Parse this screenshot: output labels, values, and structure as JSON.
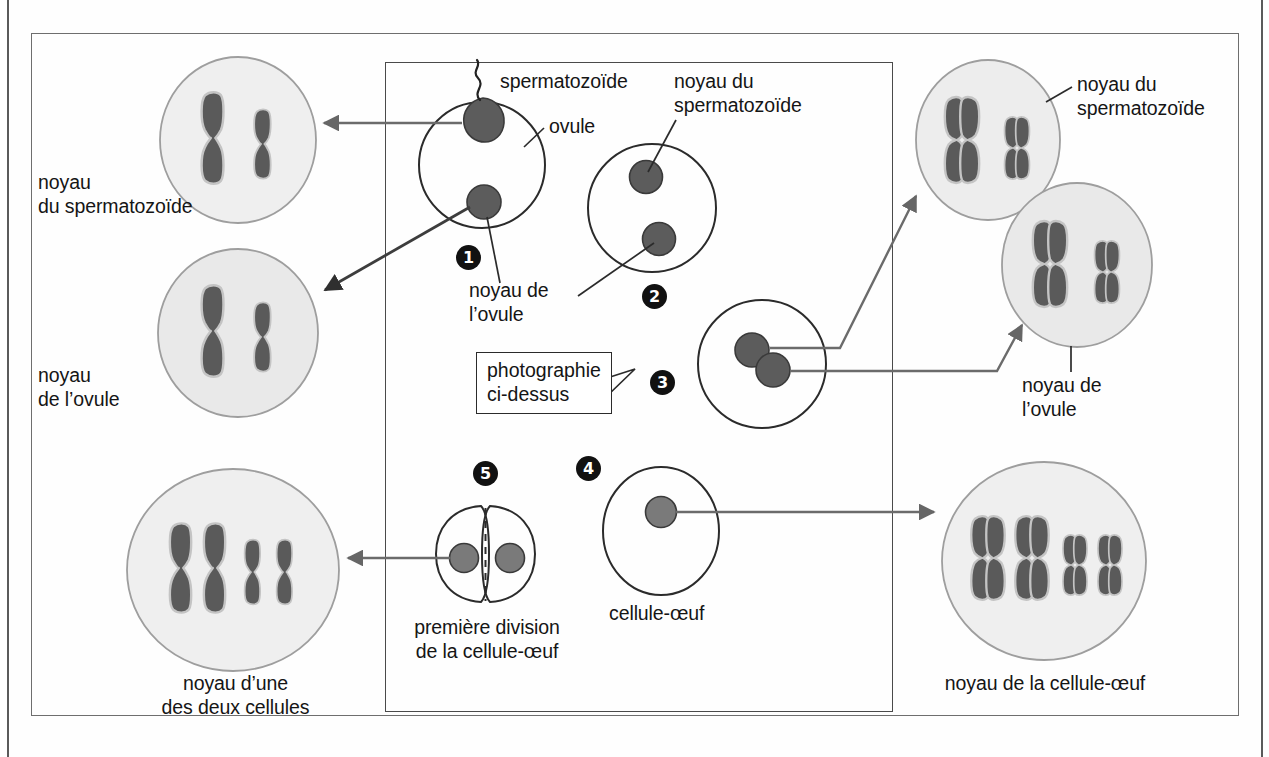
{
  "diagram": {
    "title_visible": false,
    "language": "fr",
    "colors": {
      "chromosome_fill": "#5a5a5a",
      "chromosome_stroke": "#bdbdbd",
      "nucleus_fill": "#6b6b6b",
      "nucleus_stroke": "#3a3a3a",
      "magnified_circle_fill": "#efefef",
      "magnified_circle_stroke": "#9a9a9a",
      "cell_outline": "#2b2b2b",
      "arrow": "#555555",
      "leader_line": "#2b2b2b",
      "frame": "#6e6e6e",
      "badge_bg": "#111111",
      "badge_text": "#ffffff"
    },
    "labels": {
      "noyau_du_spermatozoide_left": "noyau\ndu spermatozoïde",
      "noyau_de_lovule_left": "noyau\nde l’ovule",
      "noyau_dune_des_deux_cellules": "noyau d’une\ndes deux cellules",
      "spermatozoide": "spermatozoïde",
      "ovule": "ovule",
      "noyau_de_lovule_center": "noyau de\nl’ovule",
      "noyau_du_spermatozoide_center": "noyau du\nspermatozoïde",
      "noyau_du_spermatozoide_right": "noyau du\nspermatozoïde",
      "noyau_de_lovule_right": "noyau de\nl’ovule",
      "cellule_oeuf": "cellule-œuf",
      "premiere_division": "première division\nde la cellule-œuf",
      "noyau_de_la_cellule_oeuf": "noyau de la cellule-œuf"
    },
    "callout": {
      "text": "photographie\nci-dessus",
      "points_to_step": "3"
    },
    "steps": [
      {
        "number": "1",
        "marker": "❶",
        "caption": "ovule fécondé par le spermatozoïde"
      },
      {
        "number": "2",
        "marker": "❷",
        "caption": "les deux noyaux dans l’ovule"
      },
      {
        "number": "3",
        "marker": "❸",
        "caption": "rapprochement des deux noyaux"
      },
      {
        "number": "4",
        "marker": "❹",
        "caption": "cellule-œuf"
      },
      {
        "number": "5",
        "marker": "❺",
        "caption": "première division de la cellule-œuf"
      }
    ],
    "magnified_nuclei": [
      {
        "id": "sperm-nucleus-single",
        "chromosome_style": "single-chromatid",
        "count": 2,
        "label_key": "noyau_du_spermatozoide_left"
      },
      {
        "id": "ovule-nucleus-single",
        "chromosome_style": "single-chromatid",
        "count": 2,
        "label_key": "noyau_de_lovule_left"
      },
      {
        "id": "sperm-nucleus-doubled",
        "chromosome_style": "double-chromatid",
        "count": 2,
        "label_key": "noyau_du_spermatozoide_right"
      },
      {
        "id": "ovule-nucleus-doubled",
        "chromosome_style": "double-chromatid",
        "count": 2,
        "label_key": "noyau_de_lovule_right"
      },
      {
        "id": "egg-cell-nucleus",
        "chromosome_style": "double-chromatid",
        "count": 4,
        "label_key": "noyau_de_la_cellule_oeuf"
      },
      {
        "id": "daughter-cell-nucleus",
        "chromosome_style": "single-chromatid",
        "count": 4,
        "label_key": "noyau_dune_des_deux_cellules"
      }
    ]
  }
}
